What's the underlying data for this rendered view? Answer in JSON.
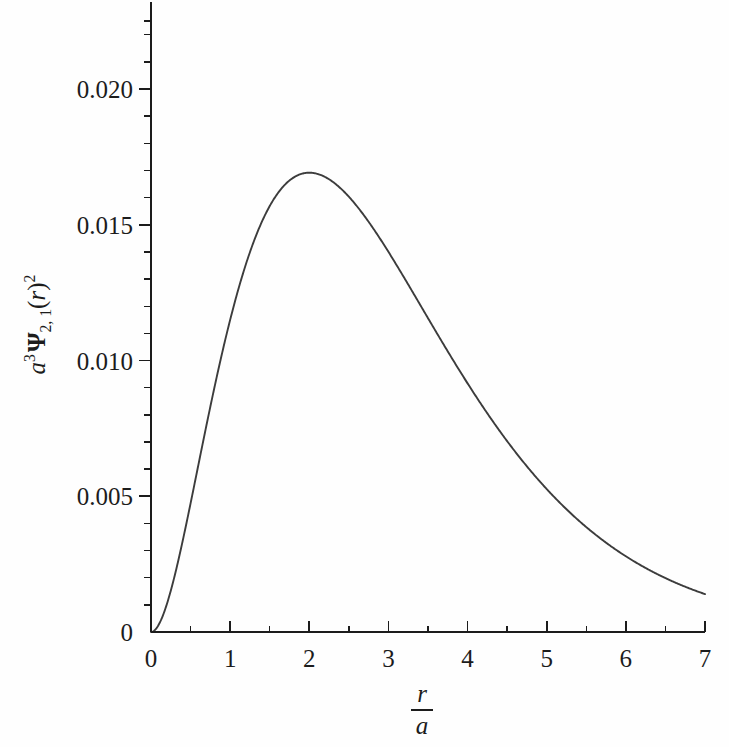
{
  "figure": {
    "background_color": "#fefefe",
    "curve_color": "#3c3c3c",
    "axis_color": "#1c1c1c",
    "text_color": "#1c1c1c"
  },
  "axis_titles": {
    "y": {
      "base_a": "a",
      "a_exponent": "3",
      "psi_symbol": "Ψ",
      "psi_subscript": "2, 1",
      "variable_open": "(",
      "variable": "r",
      "variable_close": ")",
      "squared": "2",
      "plain": "a3 Ψ 2,1 (r)2"
    },
    "x": {
      "numerator": "r",
      "denominator": "a",
      "plain": "r/a"
    }
  },
  "chart_data": {
    "type": "line",
    "title": "",
    "subtitle": "",
    "xlabel": "r/a",
    "ylabel": "a^3 psi_{2,1}(r)^2",
    "xlim": [
      0,
      7
    ],
    "ylim": [
      0,
      0.0235
    ],
    "grid": false,
    "legend": null,
    "x_ticks": [
      0,
      1,
      2,
      3,
      4,
      5,
      6,
      7
    ],
    "x_tick_labels": [
      "0",
      "1",
      "2",
      "3",
      "4",
      "5",
      "6",
      "7"
    ],
    "x_minor_ticks": [
      0.5,
      1.5,
      2.5,
      3.5,
      4.5,
      5.5,
      6.5
    ],
    "y_ticks": [
      0,
      0.005,
      0.01,
      0.015,
      0.02
    ],
    "y_tick_labels": [
      "0",
      "0.005",
      "0.010",
      "0.015",
      "0.020"
    ],
    "y_minor_ticks": [
      0.001,
      0.002,
      0.003,
      0.004,
      0.006,
      0.007,
      0.008,
      0.009,
      0.011,
      0.012,
      0.013,
      0.014,
      0.016,
      0.017,
      0.018,
      0.019,
      0.021,
      0.022
    ],
    "function": "y = (1/32) * x^2 * exp(-x)",
    "peak": {
      "x": 2.0,
      "y": 0.02256
    },
    "series": [
      {
        "name": "a^3 psi_{2,1}(r)^2",
        "color": "#3c3c3c",
        "x": [
          0,
          0.1,
          0.2,
          0.3,
          0.4,
          0.5,
          0.6,
          0.7,
          0.8,
          0.9,
          1.0,
          1.1,
          1.2,
          1.3,
          1.4,
          1.5,
          1.6,
          1.7,
          1.8,
          1.9,
          2.0,
          2.1,
          2.2,
          2.3,
          2.4,
          2.5,
          2.6,
          2.7,
          2.8,
          2.9,
          3.0,
          3.2,
          3.4,
          3.6,
          3.8,
          4.0,
          4.2,
          4.4,
          4.6,
          4.8,
          5.0,
          5.2,
          5.4,
          5.6,
          5.8,
          6.0,
          6.2,
          6.4,
          6.6,
          6.8,
          7.0
        ],
        "y": [
          0,
          2.828e-05,
          0.00010234,
          0.00020828,
          0.00033527,
          0.00047482,
          0.00061714,
          0.00076129,
          0.00089844,
          0.00102817,
          0.00114961,
          0.00126197,
          0.00136459,
          0.00145697,
          0.00153874,
          0.00160966,
          0.00166963,
          0.00171862,
          0.00175673,
          0.00178413,
          0.00180106,
          0.00180784,
          0.00180485,
          0.0017925,
          0.00177125,
          0.00174158,
          0.001704,
          0.00165902,
          0.00160718,
          0.00154901,
          0.00148503,
          0.00134168,
          0.00118291,
          0.00101477,
          0.00084247,
          0.00067037,
          0.00050204,
          0.00034031,
          0.00018736,
          4.479e-05,
          0.0,
          0.0,
          0.0,
          0.0,
          0.0,
          0.0,
          0.0,
          0.0,
          0.0,
          0.0,
          0.0
        ]
      }
    ]
  },
  "tooling": {
    "peak_label": "",
    "annotations": []
  }
}
